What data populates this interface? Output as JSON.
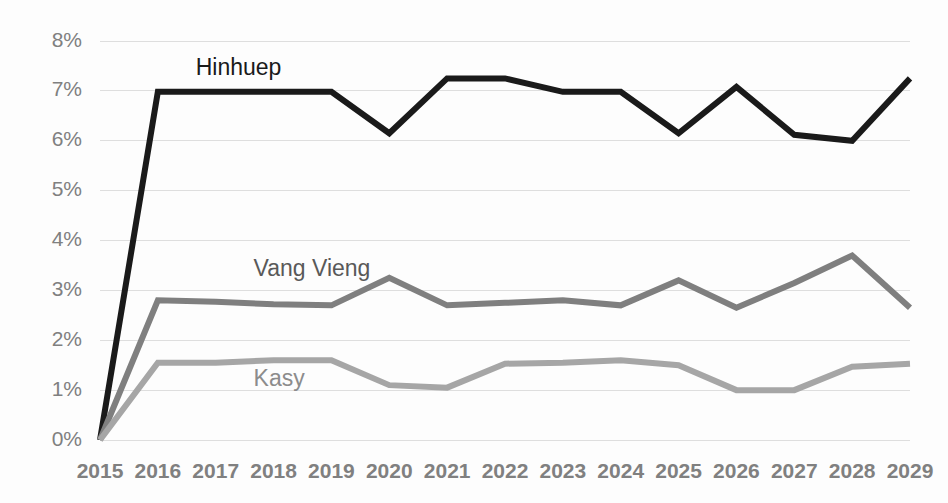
{
  "chart_data": {
    "type": "line",
    "title": "",
    "subtitle": "",
    "xlabel": "",
    "ylabel": "",
    "categories": [
      "2015",
      "2016",
      "2017",
      "2018",
      "2019",
      "2020",
      "2021",
      "2022",
      "2023",
      "2024",
      "2025",
      "2026",
      "2027",
      "2028",
      "2029"
    ],
    "ylim": [
      0,
      8
    ],
    "y_ticks": [
      0,
      1,
      2,
      3,
      4,
      5,
      6,
      7,
      8
    ],
    "y_tick_labels": [
      "0%",
      "1%",
      "2%",
      "3%",
      "4%",
      "5%",
      "6%",
      "7%",
      "8%"
    ],
    "grid": true,
    "legend_position": "inline-labels",
    "series": [
      {
        "name": "Hinhuep",
        "color": "#1a1a1a",
        "stroke_width": 6,
        "label_x_category": "2017",
        "label_value": 7.45,
        "values": [
          0,
          6.98,
          6.98,
          6.98,
          6.98,
          6.15,
          7.25,
          7.25,
          6.98,
          6.98,
          6.15,
          7.08,
          6.12,
          6.0,
          7.25
        ]
      },
      {
        "name": "Vang Vieng",
        "color": "#7f7f7f",
        "stroke_width": 6,
        "label_x_category": "2018",
        "label_value": 3.42,
        "values": [
          0,
          2.8,
          2.77,
          2.72,
          2.7,
          3.25,
          2.7,
          2.75,
          2.8,
          2.7,
          3.2,
          2.65,
          3.15,
          3.7,
          2.65
        ]
      },
      {
        "name": "Kasy",
        "color": "#a6a6a6",
        "stroke_width": 6,
        "label_x_category": "2018",
        "label_value": 1.2,
        "values": [
          0,
          1.55,
          1.55,
          1.6,
          1.6,
          1.1,
          1.05,
          1.53,
          1.55,
          1.6,
          1.5,
          1.0,
          1.0,
          1.47,
          1.53
        ]
      }
    ],
    "colors": {
      "background": "#fdfdfd",
      "gridline": "#dedede",
      "tick_text": "#808080",
      "label_hinhuep": "#1a1a1a",
      "label_vang_vieng": "#595959",
      "label_kasy": "#8c8c8c"
    }
  },
  "axis": {
    "y_labels": [
      "8%",
      "7%",
      "6%",
      "5%",
      "4%",
      "3%",
      "2%",
      "1%",
      "0%"
    ],
    "x_labels": [
      "2015",
      "2016",
      "2017",
      "2018",
      "2019",
      "2020",
      "2021",
      "2022",
      "2023",
      "2024",
      "2025",
      "2026",
      "2027",
      "2028",
      "2029"
    ]
  },
  "series_labels": {
    "hinhuep": "Hinhuep",
    "vang_vieng": "Vang Vieng",
    "kasy": "Kasy"
  }
}
